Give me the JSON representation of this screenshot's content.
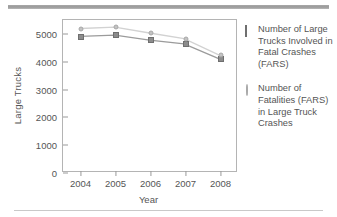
{
  "chart_data": {
    "type": "line",
    "title": "",
    "xlabel": "Year",
    "ylabel": "Large Trucks",
    "categories": [
      "2004",
      "2005",
      "2006",
      "2007",
      "2008"
    ],
    "ylim": [
      0,
      5500
    ],
    "yticks": [
      0,
      1000,
      2000,
      3000,
      4000,
      5000
    ],
    "ytick_labels": [
      "0",
      "1000",
      "2000",
      "3000",
      "4000",
      "5000"
    ],
    "grid": false,
    "legend_position": "right",
    "series": [
      {
        "name": "Number of Large Trucks Involved in Fatal Crashes (FARS)",
        "marker": "square",
        "color": "#8c8c8c",
        "values": [
          4902,
          4951,
          4766,
          4633,
          4089
        ]
      },
      {
        "name": "Number of Fatalities (FARS) in Large Truck Crashes",
        "marker": "diamond",
        "color": "#c3c3c3",
        "values": [
          5190,
          5240,
          5027,
          4822,
          4229
        ]
      }
    ]
  },
  "legend": {
    "entries": [
      {
        "label": "Number of Large Trucks Involved in Fatal Crashes (FARS)",
        "marker_name": "legend-marker-square"
      },
      {
        "label": "Number of Fatalities (FARS) in Large Truck Crashes",
        "marker_name": "legend-marker-diamond"
      }
    ]
  }
}
